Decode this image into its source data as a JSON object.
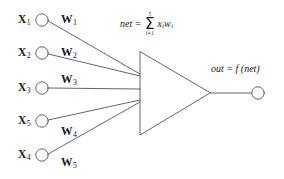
{
  "diagram": {
    "background_color": "#ffffff",
    "stroke_color": "#555555",
    "text_color": "#1a1a1a",
    "inputs": [
      {
        "name": "X",
        "index": "1",
        "weight_name": "W",
        "weight_index": "1"
      },
      {
        "name": "X",
        "index": "2",
        "weight_name": "W",
        "weight_index": "2"
      },
      {
        "name": "X",
        "index": "3",
        "weight_name": "W",
        "weight_index": "3"
      },
      {
        "name": "X",
        "index": "5",
        "weight_name": "W",
        "weight_index": "4"
      },
      {
        "name": "X",
        "index": "4",
        "weight_name": "W",
        "weight_index": "5"
      }
    ],
    "net_formula": {
      "lhs": "net",
      "equals": "=",
      "sigma": "Σ",
      "upper_limit": "5",
      "lower_limit": "i=1",
      "term": "x",
      "term_sub": "i",
      "term2": "w",
      "term2_sub": "i"
    },
    "output": {
      "label": "out = f (net)"
    }
  }
}
